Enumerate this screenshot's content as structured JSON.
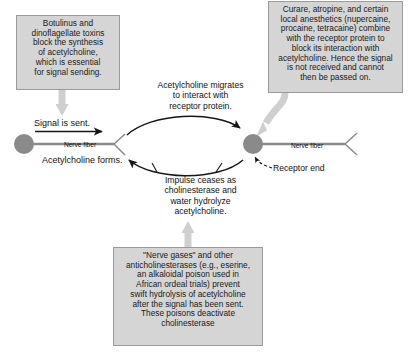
{
  "diagram": {
    "canvas": {
      "width": 409,
      "height": 358
    },
    "colors": {
      "box_fill": "#d5d5d5",
      "box_border": "#9a9a9a",
      "thick_arrow": "#cfcfcf",
      "neuron_fill": "#8a8a8a",
      "fiber_line": "#8a8a8a",
      "thin_arrow": "#161616",
      "text": "#111111",
      "background": "#ffffff"
    },
    "boxes": [
      {
        "name": "botulinus-note",
        "text": "Botulinus and\ndinoflagellate toxins\nblock the synthesis\nof acetylcholine,\nwhich is essential\nfor signal sending."
      },
      {
        "name": "curare-note",
        "text": "Curare, atropine, and certain\nlocal anesthetics (nupercaine,\nprocaine, tetracaine) combine\nwith the receptor protein to\nblock its interaction with\nacetylcholine. Hence the signal\nis not received and cannot\nthen  be passed on."
      },
      {
        "name": "nerve-gases-note",
        "text": "\"Nerve gases\" and other\nanticholinesterases (e.g., eserine,\nan alkaloidal poison used in\nAfrican ordeal trials) prevent\nswift hydrolysis of acetylcholine\nafter the signal has been sent.\nThese poisons deactivate\ncholinesterase"
      }
    ],
    "labels": {
      "acetylcholine_migrates": "Acetylcholine migrates\nto interact with\nreceptor protein.",
      "impulse_ceases": "Impulse ceases as\ncholinesterase and\nwater hydrolyze\nacetylcholine.",
      "signal_is_sent": "Signal is sent.",
      "acetylcholine_forms": "Acetylcholine forms.",
      "nerve_fiber_left": "Nerve fiber",
      "nerve_fiber_right": "Nerve fiber",
      "receptor_end": "Receptor end"
    },
    "icons": {
      "sending_neuron": "neuron-soma-circle-icon",
      "receiving_neuron": "neuron-soma-circle-icon",
      "left_axon_terminal": "axon-terminal-fork-icon",
      "right_axon_terminal": "axon-terminal-fork-icon",
      "signal_arrow": "right-arrow-icon",
      "migration_arrow": "curved-right-arrow-icon",
      "hydrolysis_arrow": "curved-left-arrow-icon",
      "receptor_pointer": "dashed-callout-arrow-icon",
      "botulinus_pointer": "thick-down-arrow-icon",
      "curare_pointer": "thick-curved-down-arrow-icon",
      "nerve_gases_pointer": "thick-up-arrow-icon"
    }
  }
}
